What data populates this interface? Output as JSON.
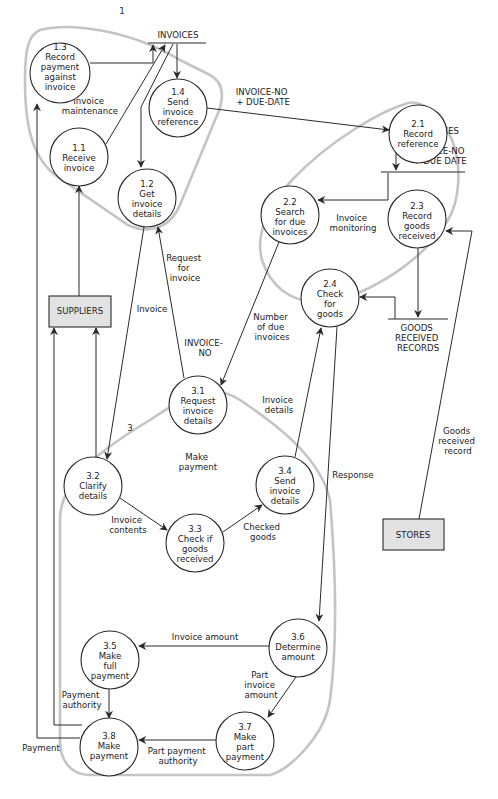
{
  "diagram": {
    "type": "data-flow-diagram",
    "groups": [
      {
        "id": "1",
        "number": "1",
        "label": "Invoice maintenance",
        "label_lines": [
          "Invoice",
          "maintenance"
        ]
      },
      {
        "id": "2",
        "number": "2",
        "label": "Invoice monitoring",
        "label_lines": [
          "Invoice",
          "monitoring"
        ]
      },
      {
        "id": "3",
        "number": "3",
        "label": "Make payment",
        "label_lines": [
          "Make",
          "payment"
        ]
      }
    ],
    "processes": {
      "p1_1": {
        "num": "1.1",
        "lines": [
          "Receive",
          "invoice"
        ]
      },
      "p1_2": {
        "num": "1.2",
        "lines": [
          "Get",
          "invoice",
          "details"
        ]
      },
      "p1_3": {
        "num": "1.3",
        "lines": [
          "Record",
          "payment",
          "against",
          "invoice"
        ]
      },
      "p1_4": {
        "num": "1.4",
        "lines": [
          "Send",
          "invoice",
          "reference"
        ]
      },
      "p2_1": {
        "num": "2.1",
        "lines": [
          "Record",
          "reference"
        ]
      },
      "p2_2": {
        "num": "2.2",
        "lines": [
          "Search",
          "for due",
          "invoices"
        ]
      },
      "p2_3": {
        "num": "2.3",
        "lines": [
          "Record",
          "goods",
          "received"
        ]
      },
      "p2_4": {
        "num": "2.4",
        "lines": [
          "Check",
          "for",
          "goods"
        ]
      },
      "p3_1": {
        "num": "3.1",
        "lines": [
          "Request",
          "invoice",
          "details"
        ]
      },
      "p3_2": {
        "num": "3.2",
        "lines": [
          "Clarify",
          "details"
        ]
      },
      "p3_3": {
        "num": "3.3",
        "lines": [
          "Check if",
          "goods",
          "received"
        ]
      },
      "p3_4": {
        "num": "3.4",
        "lines": [
          "Send",
          "invoice",
          "details"
        ]
      },
      "p3_5": {
        "num": "3.5",
        "lines": [
          "Make",
          "full",
          "payment"
        ]
      },
      "p3_6": {
        "num": "3.6",
        "lines": [
          "Determine",
          "amount"
        ]
      },
      "p3_7": {
        "num": "3.7",
        "lines": [
          "Make",
          "part",
          "payment"
        ]
      },
      "p3_8": {
        "num": "3.8",
        "lines": [
          "Make",
          "payment"
        ]
      }
    },
    "stores": {
      "invoices_top": {
        "lines": [
          "INVOICES"
        ]
      },
      "invoices_def": {
        "lines": [
          "INVOICES",
          "=",
          "INVOICE-NO",
          "+ DUE DATE"
        ]
      },
      "goods_received": {
        "lines": [
          "GOODS",
          "RECEIVED",
          "RECORDS"
        ]
      }
    },
    "externals": {
      "suppliers": {
        "label": "SUPPLIERS"
      },
      "stores": {
        "label": "STORES"
      }
    },
    "flows": {
      "invoice_no_due_date": {
        "lines": [
          "INVOICE-NO",
          "+ DUE-DATE"
        ]
      },
      "request_for_invoice": {
        "lines": [
          "Request",
          "for",
          "invoice"
        ]
      },
      "invoice": {
        "lines": [
          "Invoice"
        ]
      },
      "invoice_no": {
        "lines": [
          "INVOICE-",
          "NO"
        ]
      },
      "number_due_invoices": {
        "lines": [
          "Number",
          "of due",
          "invoices"
        ]
      },
      "invoice_details": {
        "lines": [
          "Invoice",
          "details"
        ]
      },
      "response": {
        "lines": [
          "Response"
        ]
      },
      "goods_received_record": {
        "lines": [
          "Goods",
          "received",
          "record"
        ]
      },
      "invoice_contents": {
        "lines": [
          "Invoice",
          "contents"
        ]
      },
      "checked_goods": {
        "lines": [
          "Checked",
          "goods"
        ]
      },
      "invoice_amount": {
        "lines": [
          "Invoice amount"
        ]
      },
      "part_invoice_amount": {
        "lines": [
          "Part",
          "invoice",
          "amount"
        ]
      },
      "payment_authority": {
        "lines": [
          "Payment",
          "authority"
        ]
      },
      "part_payment_authority": {
        "lines": [
          "Part payment",
          "authority"
        ]
      },
      "payment": {
        "lines": [
          "Payment"
        ]
      }
    },
    "colors": {
      "boundary": "#c4c4c4",
      "line": "#2a2a2a",
      "external_fill": "#e2e2e2",
      "background": "#ffffff"
    }
  }
}
